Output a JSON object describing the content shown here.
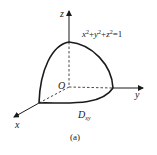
{
  "figure": {
    "caption": "(a)",
    "equation": {
      "base_x": "x",
      "exp_x": "2",
      "plus1": "+",
      "base_y": "y",
      "exp_y": "2",
      "plus2": "+",
      "base_z": "z",
      "exp_z": "2",
      "rhs": "=1"
    },
    "axes": {
      "x_label": "x",
      "y_label": "y",
      "z_label": "z",
      "origin_label": "O"
    },
    "region_label": {
      "base": "D",
      "subscript": "xy"
    },
    "colors": {
      "stroke": "#1a1a1a",
      "background": "#ffffff"
    }
  }
}
